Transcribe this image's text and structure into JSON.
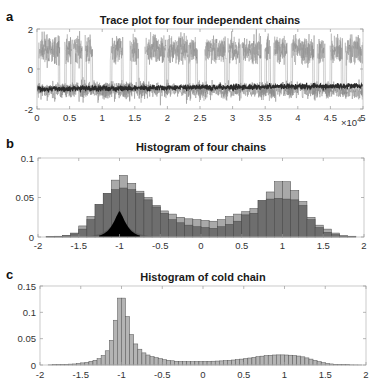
{
  "chart_data": [
    {
      "panel": "a",
      "type": "line",
      "title": "Trace plot for four independent chains",
      "xlabel": "",
      "ylabel": "",
      "xlim": [
        0,
        50000
      ],
      "ylim": [
        -2,
        2
      ],
      "x_ticks": [
        "0",
        "0.5",
        "1",
        "1.5",
        "2",
        "2.5",
        "3",
        "3.5",
        "4",
        "4.5",
        "5"
      ],
      "x_multiplier": "×10^4",
      "y_ticks": [
        "-2",
        "0",
        "2"
      ],
      "grid": false,
      "series": [
        {
          "name": "cold chain",
          "color": "#2a2a2a",
          "description": "dense band around -1, drifting to about -0.85 at end"
        },
        {
          "name": "hot chains",
          "color": "#8c8c8c",
          "description": "switches between modes near -1 and +1 (upper mode spans ~0.3 to 1.6)"
        }
      ],
      "mode_switch_segments": [
        [
          500,
          3500
        ],
        [
          4500,
          5400
        ],
        [
          5800,
          7000
        ],
        [
          7600,
          8500
        ],
        [
          11500,
          13200
        ],
        [
          14500,
          15600
        ],
        [
          16800,
          19800
        ],
        [
          20200,
          23200
        ],
        [
          23500,
          24600
        ],
        [
          26000,
          29000
        ],
        [
          29500,
          31200
        ],
        [
          31600,
          34400
        ],
        [
          35200,
          35800
        ],
        [
          36500,
          38400
        ],
        [
          39200,
          42500
        ],
        [
          43200,
          44200
        ],
        [
          45200,
          46900
        ],
        [
          47500,
          50000
        ]
      ]
    },
    {
      "panel": "b",
      "type": "bar",
      "title": "Histogram of four chains",
      "xlabel": "",
      "ylabel": "",
      "xlim": [
        -2,
        2
      ],
      "ylim": [
        0,
        0.1
      ],
      "x_ticks": [
        "-2",
        "-1.5",
        "-1",
        "-0.5",
        "0",
        "0.5",
        "1",
        "1.5",
        "2"
      ],
      "y_ticks": [
        "0",
        "0.05",
        "0.1"
      ],
      "bin_width": 0.1,
      "bin_starts": [
        -2.0,
        -1.9,
        -1.8,
        -1.7,
        -1.6,
        -1.5,
        -1.4,
        -1.3,
        -1.2,
        -1.1,
        -1.0,
        -0.9,
        -0.8,
        -0.7,
        -0.6,
        -0.5,
        -0.4,
        -0.3,
        -0.2,
        -0.1,
        0.0,
        0.1,
        0.2,
        0.3,
        0.4,
        0.5,
        0.6,
        0.7,
        0.8,
        0.9,
        1.0,
        1.1,
        1.2,
        1.3,
        1.4,
        1.5,
        1.6,
        1.7,
        1.8,
        1.9
      ],
      "series": [
        {
          "name": "chain light",
          "color": "#a9a9a9",
          "values": [
            0,
            0.0005,
            0.001,
            0.002,
            0.005,
            0.014,
            0.026,
            0.041,
            0.055,
            0.072,
            0.078,
            0.068,
            0.058,
            0.05,
            0.04,
            0.033,
            0.029,
            0.025,
            0.023,
            0.022,
            0.021,
            0.02,
            0.022,
            0.026,
            0.029,
            0.032,
            0.036,
            0.046,
            0.057,
            0.07,
            0.07,
            0.059,
            0.045,
            0.025,
            0.015,
            0.01,
            0.005,
            0.002,
            0.001,
            0
          ]
        },
        {
          "name": "chain mid",
          "color": "#6e6e6e",
          "values": [
            0,
            0.0004,
            0.0008,
            0.0015,
            0.004,
            0.01,
            0.022,
            0.041,
            0.055,
            0.06,
            0.062,
            0.06,
            0.055,
            0.047,
            0.038,
            0.03,
            0.022,
            0.018,
            0.015,
            0.013,
            0.012,
            0.011,
            0.013,
            0.016,
            0.02,
            0.028,
            0.03,
            0.046,
            0.048,
            0.049,
            0.048,
            0.047,
            0.04,
            0.022,
            0.012,
            0.006,
            0.003,
            0.001,
            0.0005,
            0
          ]
        },
        {
          "name": "cold chain",
          "color": "#000000",
          "description": "narrow peak at -1, height ~0.033, support about -1.25 to -0.75"
        }
      ]
    },
    {
      "panel": "c",
      "type": "bar",
      "title": "Histogram of cold chain",
      "xlabel": "",
      "ylabel": "",
      "xlim": [
        -2,
        2
      ],
      "ylim": [
        0,
        0.15
      ],
      "x_ticks": [
        "-2",
        "-1.5",
        "-1",
        "-0.5",
        "0",
        "0.5",
        "1",
        "1.5",
        "2"
      ],
      "y_ticks": [
        "0",
        "0.05",
        "0.1",
        "0.15"
      ],
      "bin_width": 0.05,
      "color": "#b4b4b4",
      "values": [
        0,
        0,
        0.0003,
        0.0005,
        0.0008,
        0.001,
        0.0013,
        0.0017,
        0.002,
        0.003,
        0.004,
        0.005,
        0.007,
        0.009,
        0.012,
        0.018,
        0.027,
        0.047,
        0.085,
        0.127,
        0.127,
        0.092,
        0.058,
        0.04,
        0.03,
        0.023,
        0.019,
        0.016,
        0.014,
        0.012,
        0.01,
        0.009,
        0.008,
        0.007,
        0.0068,
        0.0066,
        0.0065,
        0.0065,
        0.0066,
        0.0067,
        0.0068,
        0.007,
        0.0072,
        0.0075,
        0.0078,
        0.0082,
        0.0088,
        0.0095,
        0.0103,
        0.0112,
        0.0122,
        0.0133,
        0.0145,
        0.0157,
        0.0168,
        0.0178,
        0.0185,
        0.019,
        0.0192,
        0.0192,
        0.019,
        0.0186,
        0.018,
        0.017,
        0.0155,
        0.0135,
        0.0112,
        0.0088,
        0.0064,
        0.0045,
        0.003,
        0.002,
        0.0014,
        0.001,
        0.0007,
        0.0005,
        0.0003,
        0.0002,
        0.0001,
        0
      ]
    }
  ],
  "panels": {
    "a": {
      "label": "a",
      "title": "Trace plot for four independent chains",
      "multiplier_base": "×10",
      "multiplier_exp": "4"
    },
    "b": {
      "label": "b",
      "title": "Histogram of four chains"
    },
    "c": {
      "label": "c",
      "title": "Histogram of cold chain"
    }
  }
}
